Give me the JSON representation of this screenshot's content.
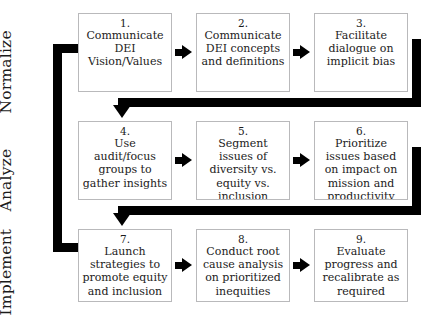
{
  "diagram": {
    "title_present": false,
    "background_color": "#ffffff",
    "connector_color": "#000000",
    "box_border_color": "#b9b9bb",
    "phases": [
      {
        "label": "Normalize"
      },
      {
        "label": "Analyze"
      },
      {
        "label": "Implement"
      }
    ],
    "nodes": [
      {
        "number": "1.",
        "text": "Communicate DEI Vision/Values"
      },
      {
        "number": "2.",
        "text": "Communicate DEI concepts and definitions"
      },
      {
        "number": "3.",
        "text": "Facilitate dialogue on implicit bias"
      },
      {
        "number": "4.",
        "text": "Use audit/focus groups to gather insights"
      },
      {
        "number": "5.",
        "text": "Segment issues of diversity vs. equity vs. inclusion"
      },
      {
        "number": "6.",
        "text": "Prioritize issues based on impact on mission and productivity"
      },
      {
        "number": "7.",
        "text": "Launch strategies to promote equity and inclusion"
      },
      {
        "number": "8.",
        "text": "Conduct root cause analysis on prioritized inequities"
      },
      {
        "number": "9.",
        "text": "Evaluate progress and recalibrate as required"
      }
    ],
    "connectors": [
      {
        "name": "arrow-1-to-2",
        "kind": "arrow-right"
      },
      {
        "name": "arrow-2-to-3",
        "kind": "arrow-right"
      },
      {
        "name": "arrow-3-to-4",
        "kind": "wrap-down-left"
      },
      {
        "name": "arrow-4-to-5",
        "kind": "arrow-right"
      },
      {
        "name": "arrow-5-to-6",
        "kind": "arrow-right"
      },
      {
        "name": "arrow-6-to-7",
        "kind": "wrap-down-left"
      },
      {
        "name": "arrow-7-to-8",
        "kind": "arrow-right"
      },
      {
        "name": "arrow-8-to-9",
        "kind": "arrow-right"
      },
      {
        "name": "feedback-loop-to-1",
        "kind": "loop-left-up"
      }
    ]
  }
}
